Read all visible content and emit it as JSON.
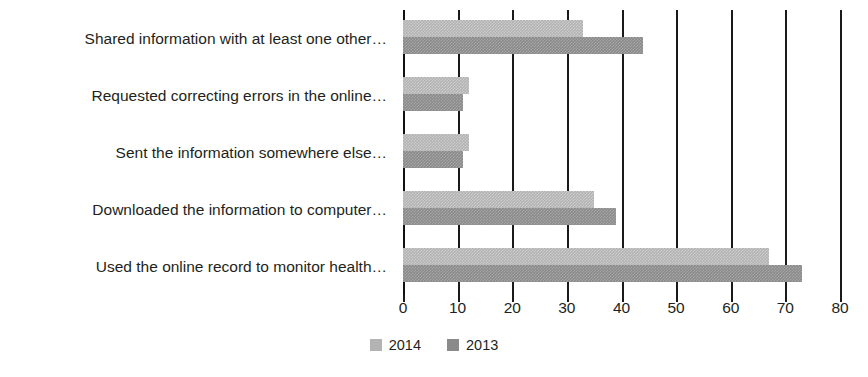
{
  "chart_data": {
    "type": "bar",
    "orientation": "horizontal",
    "title": "",
    "subtitle": "",
    "xlabel": "",
    "ylabel": "",
    "xlim": [
      0,
      80
    ],
    "xticks": [
      0,
      10,
      20,
      30,
      40,
      50,
      60,
      70,
      80
    ],
    "grid": true,
    "grid_axis": "x",
    "legend_position": "bottom-center",
    "categories": [
      "Shared information with at least one other…",
      "Requested correcting errors in the online…",
      "Sent the information somewhere else…",
      "Downloaded the information to computer…",
      "Used the online record to monitor health…"
    ],
    "series": [
      {
        "name": "2014",
        "color": "#b3b3b3",
        "values": [
          33,
          12,
          12,
          35,
          67
        ]
      },
      {
        "name": "2013",
        "color": "#8a8a8a",
        "values": [
          44,
          11,
          11,
          39,
          73
        ]
      }
    ]
  },
  "axis": {
    "tick_labels": [
      "0",
      "10",
      "20",
      "30",
      "40",
      "50",
      "60",
      "70",
      "80"
    ]
  },
  "legend": {
    "items": [
      {
        "label": "2014",
        "swatch_class": "sw-2014"
      },
      {
        "label": "2013",
        "swatch_class": "sw-2013"
      }
    ]
  },
  "colors": {
    "series_2014": "#b3b3b3",
    "series_2013": "#8a8a8a",
    "text": "#231f20",
    "grid": "#1a1a1a",
    "background": "#ffffff"
  }
}
